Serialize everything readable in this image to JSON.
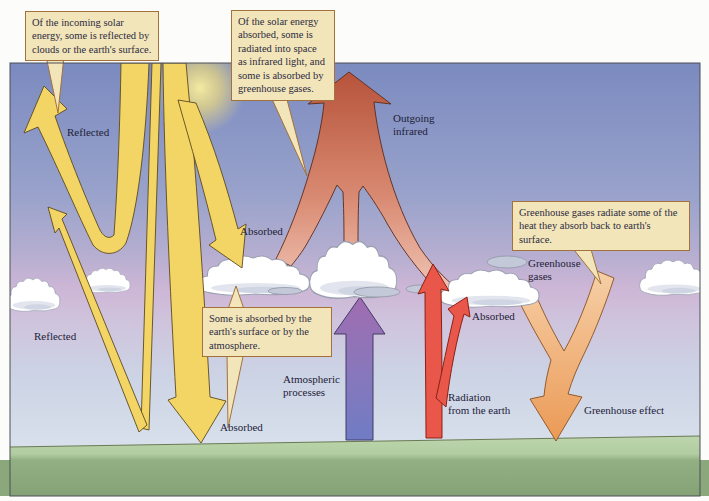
{
  "figure": {
    "callouts": [
      {
        "text": "Of the incoming solar energy, some is reflected by clouds or the earth's surface."
      },
      {
        "text": "Of the solar energy absorbed, some is radiated into space as infrared light, and some is absorbed by greenhouse gases."
      },
      {
        "text": "Greenhouse gases radiate some of the heat they absorb back to earth's surface."
      },
      {
        "text": "Some is absorbed by the earth's surface or by the atmosphere."
      }
    ],
    "labels": {
      "reflected_top": "Reflected",
      "reflected_surface": "Reflected",
      "absorbed_cloud": "Absorbed",
      "absorbed_ground": "Absorbed",
      "absorbed_greenhouse": "Absorbed",
      "greenhouse_effect": "Greenhouse effect",
      "outgoing": {
        "line1": "Outgoing",
        "line2": "infrared"
      },
      "greenhouse_gases": {
        "line1": "Greenhouse",
        "line2": "gases"
      },
      "atmospheric": {
        "line1": "Atmospheric",
        "line2": "processes"
      },
      "radiation": {
        "line1": "Radiation",
        "line2": "from the earth"
      }
    },
    "colors": {
      "solar_yellow": "#f3d565",
      "infrared_top": "#b7533b",
      "infrared_bottom": "#f2cabc",
      "atmospheric_top": "#a06cb0",
      "atmospheric_bottom": "#6f7cc4",
      "earth_radiation_red": "#e9574a",
      "greenhouse_top": "#f6d0a8",
      "greenhouse_bottom": "#eb9a56",
      "callout_bg": "#f3e5ba",
      "callout_border": "#a2713c",
      "grass_light": "#bdd5ac",
      "grass_dark": "#8aa87c"
    }
  }
}
